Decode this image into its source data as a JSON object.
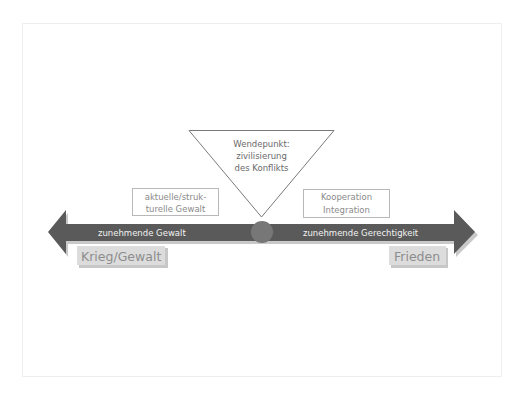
{
  "turning_point": {
    "lines": [
      "Wendepunkt:",
      "zivilisierung",
      "des Konflikts"
    ]
  },
  "left_box": {
    "lines": [
      "aktuelle/struk-",
      "turelle Gewalt"
    ]
  },
  "right_box": {
    "lines": [
      "Kooperation",
      "Integration"
    ]
  },
  "axis": {
    "left_label": "zunehmende Gewalt",
    "right_label": "zunehmende Gerechtigkeit"
  },
  "poles": {
    "left": "Krieg/Gewalt",
    "right": "Frieden"
  },
  "colors": {
    "arrow": "#5a5a5a",
    "arrow_shadow": "#c4c4c4",
    "circle": "#777777",
    "box_border": "#b8b8b8",
    "box_text": "#8a8a8a",
    "axis_text": "#f2f2f2",
    "pole_fill": "#dcdcdc",
    "pole_text": "#8d8d8d",
    "triangle_border": "#7a7a7a",
    "triangle_text": "#6a6a6a"
  }
}
